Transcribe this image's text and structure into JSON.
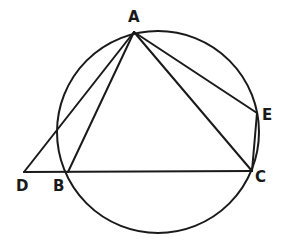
{
  "figure": {
    "type": "geometry-diagram",
    "stroke_color": "#1a1a1a",
    "background": "#ffffff",
    "circle": {
      "cx": 158,
      "cy": 132,
      "r": 101
    },
    "points": {
      "A": {
        "x": 134,
        "y": 32,
        "label": "A",
        "label_x": 128,
        "label_y": 10
      },
      "B": {
        "x": 68,
        "y": 172,
        "label": "B",
        "label_x": 53,
        "label_y": 179
      },
      "C": {
        "x": 252,
        "y": 171,
        "label": "C",
        "label_x": 255,
        "label_y": 170
      },
      "D": {
        "x": 24,
        "y": 172,
        "label": "D",
        "label_x": 16,
        "label_y": 179
      },
      "E": {
        "x": 257,
        "y": 113,
        "label": "E",
        "label_x": 262,
        "label_y": 108
      }
    },
    "segments": [
      [
        "A",
        "D"
      ],
      [
        "A",
        "B"
      ],
      [
        "A",
        "C"
      ],
      [
        "A",
        "E"
      ],
      [
        "D",
        "C"
      ],
      [
        "E",
        "C"
      ]
    ]
  }
}
